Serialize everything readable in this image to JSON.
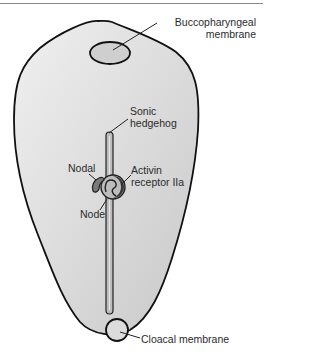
{
  "diagram": {
    "title": "",
    "labels": {
      "buccopharyngeal_line1": "Buccopharyngeal",
      "buccopharyngeal_line2": "membrane",
      "sonic_line1": "Sonic",
      "sonic_line2": "hedgehog",
      "nodal": "Nodal",
      "activin_line1": "Activin",
      "activin_line2": "receptor IIa",
      "node": "Node",
      "cloacal": "Cloacal membrane"
    },
    "colors": {
      "embryo_fill": "#e4e4e4",
      "outline": "#111111",
      "membrane_fill": "#cfcfcf",
      "streak_fill": "#bdbdbd",
      "receptor_fill": "#3a3a3a",
      "nodal_fill": "#7a7a7a"
    }
  }
}
